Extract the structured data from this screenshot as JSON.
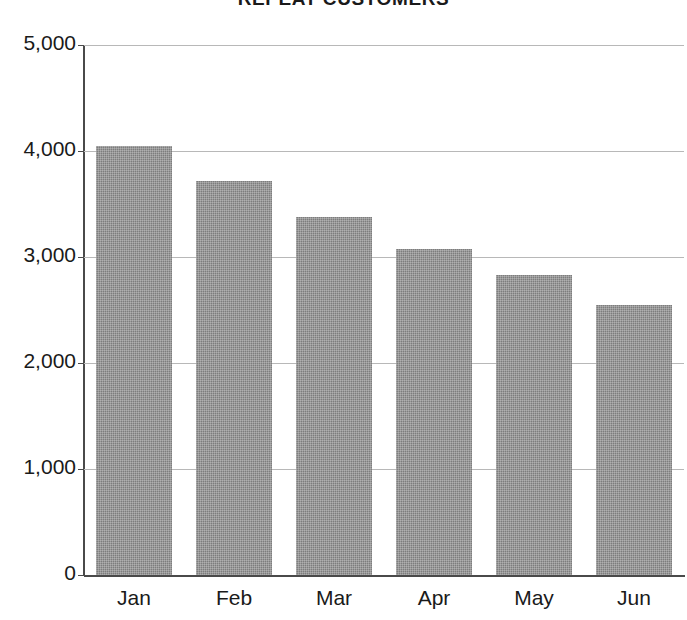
{
  "chart_data": {
    "type": "bar",
    "title": "REPEAT CUSTOMERS",
    "xlabel": "",
    "ylabel": "",
    "categories": [
      "Jan",
      "Feb",
      "Mar",
      "Apr",
      "May",
      "Jun"
    ],
    "values": [
      4050,
      3720,
      3380,
      3080,
      2830,
      2550
    ],
    "ylim": [
      0,
      5000
    ],
    "yticks": [
      0,
      1000,
      2000,
      3000,
      4000,
      5000
    ],
    "ytick_labels": [
      "0",
      "1,000",
      "2,000",
      "3,000",
      "4,000",
      "5,000"
    ],
    "grid": true,
    "legend": null,
    "series": [
      {
        "name": "Repeat Customers",
        "values": [
          4050,
          3720,
          3380,
          3080,
          2830,
          2550
        ]
      }
    ],
    "colors": {
      "bar_fill": "#7d7d7d",
      "axis": "#4a4a4a",
      "gridline": "#b8b8b8",
      "text": "#1a1a1a",
      "background": "#ffffff"
    }
  }
}
